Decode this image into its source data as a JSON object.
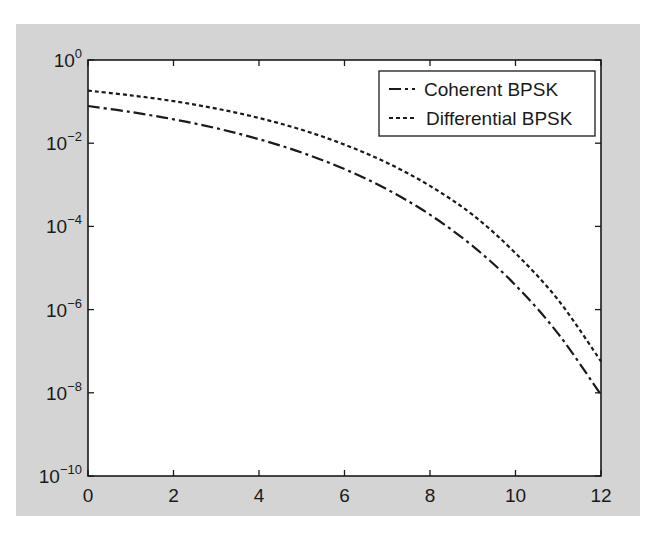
{
  "chart_data": {
    "type": "line",
    "title": "",
    "xlabel": "",
    "ylabel": "",
    "xscale": "linear",
    "yscale": "log",
    "xlim": [
      0,
      12
    ],
    "ylim": [
      1e-10,
      1
    ],
    "grid": false,
    "legend_position": "upper right",
    "x_ticks": [
      0,
      2,
      4,
      6,
      8,
      10,
      12
    ],
    "x_tick_labels": [
      "0",
      "2",
      "4",
      "6",
      "8",
      "10",
      "12"
    ],
    "y_ticks": [
      1,
      0.01,
      0.0001,
      1e-06,
      1e-08,
      1e-10
    ],
    "y_tick_labels": [
      {
        "base": "10",
        "exp": "0"
      },
      {
        "base": "10",
        "exp": "−2"
      },
      {
        "base": "10",
        "exp": "−4"
      },
      {
        "base": "10",
        "exp": "−6"
      },
      {
        "base": "10",
        "exp": "−8"
      },
      {
        "base": "10",
        "exp": "−10"
      }
    ],
    "x": [
      0,
      1,
      2,
      3,
      4,
      5,
      6,
      7,
      8,
      9,
      10,
      11,
      12
    ],
    "series": [
      {
        "name": "Coherent BPSK",
        "line_style": "dash-dot",
        "color": "#1a1a1a",
        "values": [
          0.0786,
          0.0563,
          0.0375,
          0.0229,
          0.0125,
          0.00595,
          0.00239,
          0.000773,
          0.000191,
          3.36e-05,
          3.87e-06,
          2.61e-07,
          9e-09
        ]
      },
      {
        "name": "Differential BPSK",
        "line_style": "dotted",
        "color": "#1a1a1a",
        "values": [
          0.184,
          0.141,
          0.103,
          0.0679,
          0.0404,
          0.021,
          0.00927,
          0.00336,
          0.00094,
          0.000189,
          2.27e-05,
          1.69e-06,
          5.7e-08
        ]
      }
    ]
  },
  "colors": {
    "figure_background": "#d4d4d4",
    "plot_background": "#ffffff",
    "axis": "#1a1a1a"
  }
}
